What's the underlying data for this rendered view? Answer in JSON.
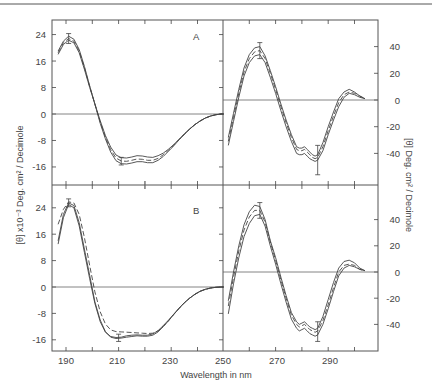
{
  "figure": {
    "x_axis_title": "Wavelength in nm",
    "left_y_axis_title": "[θ] x10⁻³ Deg. cm² / Decimole",
    "right_y_axis_title": "[θ] Deg. cm² / Decimole",
    "panel_labels": [
      "A",
      "B"
    ],
    "x_tick_labels": [
      "190",
      "210",
      "230",
      "250",
      "270",
      "290"
    ]
  },
  "chart_data": [
    {
      "id": "A-far-uv",
      "type": "line",
      "panel": "A",
      "title": "",
      "xlabel": "Wavelength in nm",
      "ylabel": "[θ] x10⁻³ Deg. cm²/Decimole",
      "xlim": [
        185,
        250
      ],
      "ylim": [
        -21,
        27
      ],
      "yticks": [
        24,
        16,
        8,
        0,
        -8,
        -16
      ],
      "grid": false,
      "zero_line": true,
      "x": [
        187,
        189,
        191,
        193,
        195,
        197,
        199,
        201,
        203,
        205,
        207,
        209,
        211,
        213,
        215,
        217,
        219,
        221,
        223,
        225,
        227,
        229,
        231,
        233,
        235,
        237,
        239,
        241,
        243,
        245,
        247,
        249,
        250
      ],
      "series": [
        {
          "name": "curve-1 (solid, upper)",
          "style": "solid",
          "values": [
            18,
            21,
            22.3,
            21.5,
            18.5,
            13.5,
            8,
            3,
            -2,
            -6.5,
            -10,
            -12.4,
            -13.2,
            -13.3,
            -13.0,
            -12.6,
            -12.7,
            -13.0,
            -13.1,
            -12.6,
            -11.8,
            -10.6,
            -9.2,
            -7.6,
            -6.0,
            -4.5,
            -3.2,
            -2.1,
            -1.2,
            -0.6,
            -0.2,
            0,
            0
          ]
        },
        {
          "name": "curve-2 (dashed)",
          "style": "dashed",
          "values": [
            18.5,
            21.5,
            22.8,
            22,
            19,
            14,
            8.3,
            3,
            -2.4,
            -7,
            -10.8,
            -13.3,
            -14.2,
            -14.3,
            -14.0,
            -13.6,
            -13.7,
            -14.0,
            -14.0,
            -13.4,
            -12.3,
            -10.9,
            -9.4,
            -7.7,
            -6.1,
            -4.6,
            -3.2,
            -2.1,
            -1.2,
            -0.6,
            -0.2,
            0,
            0
          ]
        },
        {
          "name": "curve-3 (solid, lower)",
          "style": "solid",
          "values": [
            19,
            22,
            23.5,
            22.6,
            19.5,
            14.4,
            8.5,
            3,
            -2.8,
            -7.5,
            -11.5,
            -14.1,
            -15.0,
            -15.1,
            -14.8,
            -14.4,
            -14.4,
            -14.7,
            -14.7,
            -14.0,
            -12.8,
            -11.2,
            -9.6,
            -7.8,
            -6.2,
            -4.6,
            -3.2,
            -2.1,
            -1.2,
            -0.6,
            -0.2,
            0,
            0
          ]
        }
      ],
      "error_bars": [
        {
          "x": 191,
          "y": 22.8,
          "low": 21.3,
          "high": 24.3
        },
        {
          "x": 211,
          "y": -14.2,
          "low": -15.4,
          "high": -13.1
        }
      ]
    },
    {
      "id": "A-near-uv",
      "type": "line",
      "panel": "A",
      "title": "",
      "xlabel": "Wavelength in nm",
      "ylabel": "[θ] Deg. cm²/Decimole",
      "xlim": [
        250,
        308.7
      ],
      "ylim": [
        -64,
        61
      ],
      "yticks": [
        40,
        20,
        0,
        -20,
        -40
      ],
      "grid": false,
      "zero_line": true,
      "x": [
        252,
        254,
        256,
        258,
        260,
        262,
        264,
        266,
        268,
        270,
        272,
        274,
        276,
        278,
        279,
        280,
        281,
        282,
        283,
        284,
        285,
        286,
        288,
        290,
        292,
        294,
        296,
        298,
        300,
        302,
        304
      ],
      "series": [
        {
          "name": "curve-1 (solid, upper)",
          "style": "solid",
          "values": [
            -28,
            -10,
            8,
            24,
            34,
            39,
            40,
            33,
            22,
            10,
            -3,
            -15,
            -26,
            -35,
            -36,
            -36,
            -35,
            -37,
            -39,
            -41,
            -42,
            -41,
            -32,
            -20,
            -9,
            1,
            6,
            8,
            6,
            3,
            1
          ]
        },
        {
          "name": "curve-2 (dashed)",
          "style": "dashed",
          "values": [
            -31,
            -13,
            5,
            21,
            31,
            36,
            37,
            31,
            20,
            8,
            -5,
            -17,
            -28,
            -37,
            -38,
            -38,
            -37,
            -39,
            -41,
            -43,
            -44,
            -43,
            -35,
            -23,
            -12,
            -2,
            4,
            6,
            5,
            3,
            1
          ]
        },
        {
          "name": "curve-3 (solid, lower)",
          "style": "solid",
          "values": [
            -34,
            -16,
            2,
            18,
            28,
            33,
            34,
            28,
            17,
            5,
            -8,
            -20,
            -31,
            -40,
            -41,
            -41,
            -40,
            -42,
            -44,
            -45,
            -46,
            -45,
            -38,
            -26,
            -15,
            -5,
            2,
            5,
            4,
            2,
            1
          ]
        }
      ],
      "error_bars": [
        {
          "x": 264,
          "y": 37,
          "low": 31,
          "high": 43
        },
        {
          "x": 286,
          "y": -43,
          "low": -56,
          "high": -34
        }
      ]
    },
    {
      "id": "B-far-uv",
      "type": "line",
      "panel": "B",
      "title": "",
      "xlabel": "Wavelength in nm",
      "ylabel": "[θ] x10⁻³ Deg. cm²/Decimole",
      "xlim": [
        185,
        250
      ],
      "ylim": [
        -20,
        30
      ],
      "yticks": [
        24,
        16,
        8,
        0,
        -8,
        -16
      ],
      "grid": false,
      "zero_line": true,
      "x": [
        187,
        189,
        191,
        193,
        195,
        197,
        199,
        201,
        203,
        205,
        207,
        209,
        211,
        213,
        215,
        217,
        219,
        221,
        223,
        225,
        227,
        229,
        231,
        233,
        235,
        237,
        239,
        241,
        243,
        245,
        247,
        249,
        250
      ],
      "series": [
        {
          "name": "curve-1 (solid)",
          "style": "solid",
          "values": [
            13,
            21,
            25,
            24,
            18.5,
            10.5,
            2.5,
            -5,
            -10.5,
            -13.7,
            -15.0,
            -15.3,
            -15.2,
            -14.8,
            -14.6,
            -14.5,
            -14.6,
            -14.6,
            -14.2,
            -13.2,
            -11.7,
            -10.0,
            -8.2,
            -6.4,
            -4.8,
            -3.4,
            -2.2,
            -1.3,
            -0.7,
            -0.3,
            -0.1,
            0,
            0
          ]
        },
        {
          "name": "curve-2 (solid)",
          "style": "solid",
          "values": [
            14,
            22,
            25.5,
            24.7,
            19.5,
            11.5,
            3.5,
            -4.5,
            -10,
            -13.5,
            -15.2,
            -15.6,
            -15.5,
            -15.2,
            -15.0,
            -14.8,
            -14.9,
            -14.9,
            -14.6,
            -13.6,
            -12.0,
            -10.2,
            -8.3,
            -6.5,
            -4.8,
            -3.4,
            -2.2,
            -1.3,
            -0.7,
            -0.3,
            -0.1,
            0,
            0
          ]
        },
        {
          "name": "curve-3 (dashed)",
          "style": "dashed",
          "values": [
            19,
            23.5,
            25.8,
            25.5,
            22,
            15,
            6.5,
            -1.5,
            -7.5,
            -11.2,
            -13.0,
            -13.5,
            -13.6,
            -13.7,
            -13.8,
            -13.9,
            -14.0,
            -14.1,
            -14.0,
            -13.3,
            -11.9,
            -10.2,
            -8.3,
            -6.5,
            -4.8,
            -3.4,
            -2.2,
            -1.3,
            -0.7,
            -0.3,
            -0.1,
            0,
            0
          ]
        }
      ],
      "error_bars": [
        {
          "x": 191,
          "y": 25.5,
          "low": 24.3,
          "high": 26.7
        },
        {
          "x": 210,
          "y": -15.4,
          "low": -16.5,
          "high": -14.3
        }
      ]
    },
    {
      "id": "B-near-uv",
      "type": "line",
      "panel": "B",
      "title": "",
      "xlabel": "Wavelength in nm",
      "ylabel": "[θ] Deg. cm²/Decimole",
      "xlim": [
        250,
        308.7
      ],
      "ylim": [
        -60,
        66
      ],
      "yticks": [
        40,
        20,
        0,
        -20,
        -40
      ],
      "grid": false,
      "zero_line": true,
      "x": [
        252,
        254,
        256,
        258,
        260,
        262,
        264,
        266,
        268,
        270,
        272,
        274,
        276,
        278,
        279,
        280,
        281,
        282,
        283,
        284,
        285,
        286,
        288,
        290,
        292,
        294,
        296,
        298,
        300,
        302,
        304
      ],
      "series": [
        {
          "name": "curve-1 (solid, upper)",
          "style": "solid",
          "values": [
            -22,
            0,
            20,
            36,
            46,
            51,
            50,
            40,
            24,
            11,
            -4,
            -18,
            -31,
            -38,
            -40,
            -39,
            -38,
            -40,
            -42,
            -43,
            -44,
            -43,
            -34,
            -21,
            -8,
            3,
            8,
            9,
            7,
            3,
            1
          ]
        },
        {
          "name": "curve-2 (dashed)",
          "style": "dashed",
          "values": [
            -26,
            -4,
            16,
            32,
            42,
            47,
            47,
            38,
            23,
            9,
            -6,
            -20,
            -33,
            -40,
            -42,
            -41,
            -40,
            -42,
            -44,
            -45,
            -46,
            -45,
            -37,
            -25,
            -12,
            0,
            5,
            6,
            5,
            2,
            1
          ]
        },
        {
          "name": "curve-3 (solid, lower)",
          "style": "solid",
          "values": [
            -32,
            -9,
            11,
            27,
            37,
            43,
            44,
            35,
            20,
            6,
            -9,
            -23,
            -36,
            -43,
            -45,
            -44,
            -43,
            -45,
            -47,
            -48,
            -49,
            -48,
            -40,
            -28,
            -15,
            -3,
            3,
            5,
            4,
            2,
            1
          ]
        }
      ],
      "error_bars": [
        {
          "x": 264,
          "y": 47,
          "low": 41,
          "high": 53
        },
        {
          "x": 286,
          "y": -46,
          "low": -53,
          "high": -38
        }
      ]
    }
  ]
}
